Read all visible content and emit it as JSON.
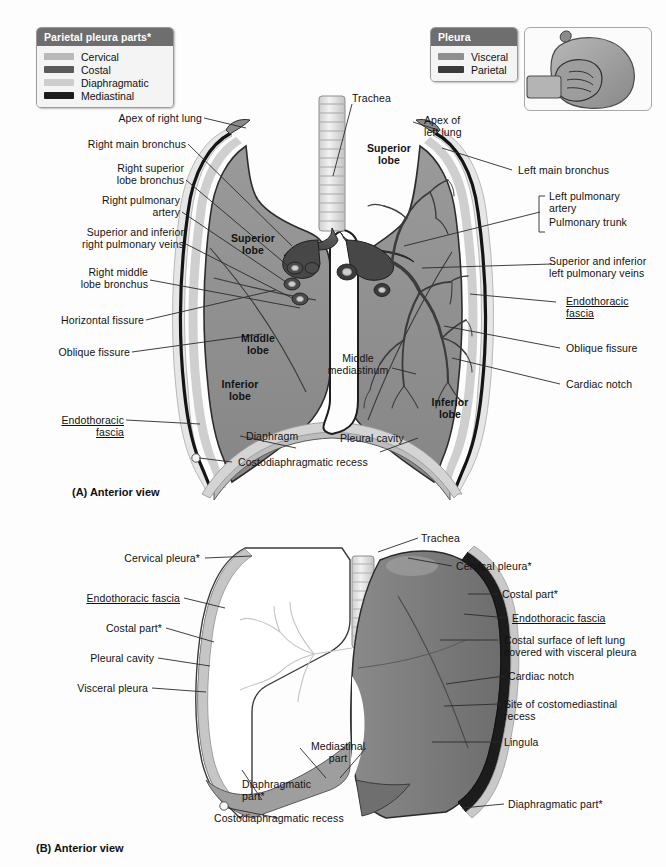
{
  "figure": {
    "panelA_caption": "(A) Anterior view",
    "panelB_caption": "(B) Anterior view"
  },
  "legends": [
    {
      "name": "parietal-pleura-parts",
      "title": "Parietal pleura parts*",
      "items": [
        {
          "label": "Cervical",
          "color": "#b9b9b9"
        },
        {
          "label": "Costal",
          "color": "#5a5a5a"
        },
        {
          "label": "Diaphragmatic",
          "color": "#cdcdcd"
        },
        {
          "label": "Mediastinal",
          "color": "#1b1b1b"
        }
      ]
    },
    {
      "name": "pleura",
      "title": "Pleura",
      "items": [
        {
          "label": "Visceral",
          "color": "#8f8f8f"
        },
        {
          "label": "Parietal",
          "color": "#3a3a3a"
        }
      ]
    }
  ],
  "inset": {
    "name": "fist-in-balloon-illustration",
    "alt": "Fist pushed into a balloon demonstrating visceral and parietal layers"
  },
  "panelA": {
    "name": "anterior-view-thorax-lungs",
    "labels_left": [
      {
        "id": "apex-right-lung",
        "text": "Apex of right lung"
      },
      {
        "id": "right-main-bronchus",
        "text": "Right main bronchus"
      },
      {
        "id": "right-superior-lobe-bronchus",
        "text": "Right superior\nlobe bronchus"
      },
      {
        "id": "right-pulmonary-artery",
        "text": "Right pulmonary\nartery"
      },
      {
        "id": "right-pulmonary-veins",
        "text": "Superior and inferior\nright pulmonary veins"
      },
      {
        "id": "right-middle-lobe-bronchus",
        "text": "Right middle\nlobe bronchus"
      },
      {
        "id": "horizontal-fissure",
        "text": "Horizontal fissure"
      },
      {
        "id": "oblique-fissure-left",
        "text": "Oblique fissure"
      },
      {
        "id": "endothoracic-fascia-left",
        "text": "Endothoracic\nfascia",
        "underline": true
      }
    ],
    "labels_right": [
      {
        "id": "apex-left-lung",
        "text": "Apex of\nleft lung"
      },
      {
        "id": "left-main-bronchus",
        "text": "Left main bronchus"
      },
      {
        "id": "left-pulmonary-artery",
        "text": "Left pulmonary\nartery"
      },
      {
        "id": "pulmonary-trunk",
        "text": "Pulmonary trunk"
      },
      {
        "id": "left-pulmonary-veins",
        "text": "Superior and inferior\nleft pulmonary veins"
      },
      {
        "id": "endothoracic-fascia-right",
        "text": "Endothoracic\nfascia",
        "underline": true
      },
      {
        "id": "oblique-fissure-right",
        "text": "Oblique fissure"
      },
      {
        "id": "cardiac-notch",
        "text": "Cardiac notch"
      }
    ],
    "labels_inner": [
      {
        "id": "trachea",
        "text": "Trachea"
      },
      {
        "id": "superior-lobe-left",
        "text": "Superior\nlobe",
        "bold": true
      },
      {
        "id": "superior-lobe-right",
        "text": "Superior\nlobe",
        "bold": true
      },
      {
        "id": "middle-lobe",
        "text": "Middle\nlobe",
        "bold": true
      },
      {
        "id": "inferior-lobe-right",
        "text": "Inferior\nlobe",
        "bold": true
      },
      {
        "id": "inferior-lobe-left",
        "text": "Inferior\nlobe",
        "bold": true
      },
      {
        "id": "middle-mediastinum",
        "text": "Middle\nmediastinum"
      },
      {
        "id": "diaphragm",
        "text": "Diaphragm"
      },
      {
        "id": "pleural-cavity",
        "text": "Pleural cavity"
      },
      {
        "id": "costodiaphragmatic-recess",
        "text": "Costodiaphragmatic recess"
      }
    ]
  },
  "panelB": {
    "name": "anterior-view-left-lung-pleura",
    "labels_left": [
      {
        "id": "cervical-pleura-left",
        "text": "Cervical pleura*"
      },
      {
        "id": "endothoracic-fascia-b-left",
        "text": "Endothoracic fascia",
        "underline": true
      },
      {
        "id": "costal-part-left",
        "text": "Costal part*"
      },
      {
        "id": "pleural-cavity-b",
        "text": "Pleural cavity"
      },
      {
        "id": "visceral-pleura-b",
        "text": "Visceral pleura"
      }
    ],
    "labels_right": [
      {
        "id": "trachea-b",
        "text": "Trachea"
      },
      {
        "id": "cervical-pleura-right",
        "text": "Cervical pleura*"
      },
      {
        "id": "costal-part-right",
        "text": "Costal part*"
      },
      {
        "id": "endothoracic-fascia-b-right",
        "text": "Endothoracic fascia",
        "underline": true
      },
      {
        "id": "costal-surface-left-lung",
        "text": "Costal surface of left lung\ncovered with visceral pleura"
      },
      {
        "id": "cardiac-notch-b",
        "text": "Cardiac notch"
      },
      {
        "id": "costomediastinal-recess",
        "text": "Site of costomediastinal\nrecess"
      },
      {
        "id": "lingula",
        "text": "Lingula"
      },
      {
        "id": "diaphragmatic-part-right",
        "text": "Diaphragmatic part*"
      }
    ],
    "labels_inner": [
      {
        "id": "mediastinal-part",
        "text": "Mediastinal\npart"
      },
      {
        "id": "diaphragmatic-part-b",
        "text": "Diaphragmatic\npart*"
      },
      {
        "id": "costodiaphragmatic-recess-b",
        "text": "Costodiaphragmatic recess"
      }
    ]
  },
  "colors": {
    "lung_fill": "#8d8d8d",
    "parietal_dark": "#1b1b1b",
    "cavity_light": "#d8d8d8",
    "background": "#fdfdfd",
    "legend_header": "#6e6e6e",
    "lung_b_fill": "#7b7b7b",
    "leader": "#2a2a2a"
  }
}
